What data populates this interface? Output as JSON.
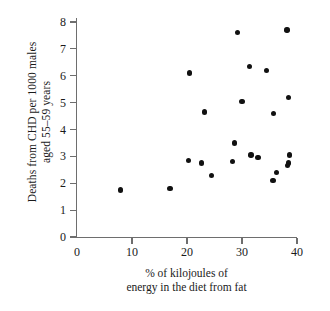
{
  "chart_data": {
    "type": "scatter",
    "title": "",
    "xlabel": "% of kilojoules of\nenergy in the diet from fat",
    "ylabel": "Deaths from CHD per 1000 males\naged 55–59 years",
    "xlim": [
      0,
      40
    ],
    "ylim": [
      0,
      8
    ],
    "xticks": [
      0,
      10,
      20,
      30,
      40
    ],
    "yticks": [
      0,
      1,
      2,
      3,
      4,
      5,
      6,
      7,
      8
    ],
    "xtick_labels": [
      "0",
      "10",
      "20",
      "30",
      "40"
    ],
    "ytick_labels": [
      "0",
      "1",
      "2",
      "3",
      "4",
      "5",
      "6",
      "7",
      "8"
    ],
    "grid": false,
    "legend": false,
    "marker": "filled-circle",
    "marker_color": "#111111",
    "axis_color": "#6e6e6e",
    "points": [
      {
        "x": 7.9,
        "y": 1.75
      },
      {
        "x": 16.9,
        "y": 1.8
      },
      {
        "x": 20.4,
        "y": 6.1
      },
      {
        "x": 20.3,
        "y": 2.85
      },
      {
        "x": 22.6,
        "y": 2.75
      },
      {
        "x": 23.2,
        "y": 4.65
      },
      {
        "x": 24.5,
        "y": 2.3
      },
      {
        "x": 28.3,
        "y": 2.8
      },
      {
        "x": 29.2,
        "y": 7.6
      },
      {
        "x": 28.6,
        "y": 3.5
      },
      {
        "x": 30.0,
        "y": 5.05
      },
      {
        "x": 31.6,
        "y": 3.05
      },
      {
        "x": 31.4,
        "y": 6.35
      },
      {
        "x": 32.9,
        "y": 2.95
      },
      {
        "x": 34.4,
        "y": 6.2
      },
      {
        "x": 35.7,
        "y": 4.6
      },
      {
        "x": 36.3,
        "y": 2.4
      },
      {
        "x": 35.6,
        "y": 2.1
      },
      {
        "x": 38.2,
        "y": 7.7
      },
      {
        "x": 38.5,
        "y": 5.2
      },
      {
        "x": 38.6,
        "y": 3.05
      },
      {
        "x": 38.4,
        "y": 2.75
      },
      {
        "x": 38.3,
        "y": 2.65
      }
    ]
  }
}
